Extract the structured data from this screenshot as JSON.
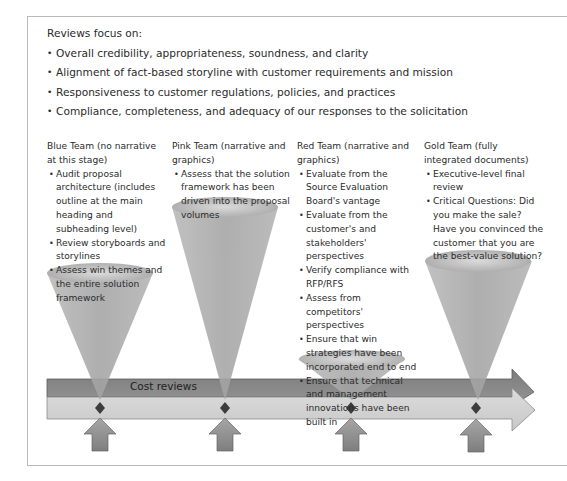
{
  "intro": {
    "heading": "Reviews focus on:",
    "bullets": [
      "Overall credibility, appropriateness, soundness, and clarity",
      "Alignment of fact-based storyline with customer requirements and mission",
      "Responsiveness to customer regulations, policies, and practices",
      "Compliance, completeness, and adequacy of our responses to the solicitation"
    ]
  },
  "teams": [
    {
      "name": "Blue Team (no narrative at this stage)",
      "bullets": [
        "Audit proposal architecture (includes outline at the main heading and subheading level)",
        "Review storyboards and storylines",
        "Assess win themes and the entire solution framework"
      ]
    },
    {
      "name": "Pink Team (narrative and graphics)",
      "bullets": [
        "Assess that the solution framework has been driven into the proposal volumes"
      ]
    },
    {
      "name": "Red Team (narrative and graphics)",
      "bullets": [
        "Evaluate from the Source Evaluation Board's vantage",
        "Evaluate from the customer's and stakeholders' perspectives",
        "Verify compliance with RFP/RFS",
        "Assess from competitors' perspectives",
        "Ensure that win strategies have been incorporated end to end",
        "Ensure that technical and management innovations have been built in"
      ]
    },
    {
      "name": "Gold Team (fully integrated documents)",
      "bullets": [
        "Executive-level final review",
        "Critical Questions: Did you make the sale? Have you convinced the customer that you are the best-value solution?"
      ]
    }
  ],
  "timeline": {
    "cost_bar_label": "Cost reviews",
    "colors": {
      "dark_bar": "#8a8a8a",
      "light_bar": "#d4d4d4",
      "cone": "#a9a9a9",
      "up_arrow": "#8f8f8f",
      "diamond": "#3a3a3a"
    }
  }
}
